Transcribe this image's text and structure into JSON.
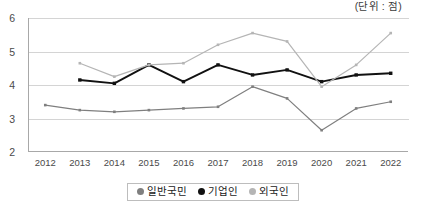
{
  "unit_label": "(단위 : 점)",
  "legend": {
    "position": "bottom-center",
    "items": [
      {
        "label": "일반국민",
        "color": "#7f7f7f"
      },
      {
        "label": "기업인",
        "color": "#111111"
      },
      {
        "label": "외국인",
        "color": "#b5b5b5"
      }
    ]
  },
  "axis": {
    "y_ticks": [
      "2",
      "3",
      "4",
      "5",
      "6"
    ],
    "x_ticks": [
      "2012",
      "2013",
      "2014",
      "2015",
      "2016",
      "2017",
      "2018",
      "2019",
      "2020",
      "2021",
      "2022"
    ]
  },
  "chart_data": {
    "type": "line",
    "title": "",
    "subtitle": "",
    "xlabel": "",
    "ylabel": "",
    "unit": "(단위 : 점)",
    "ylim": [
      2,
      6
    ],
    "ytick_values": [
      2,
      3,
      4,
      5,
      6
    ],
    "grid": true,
    "legend_position": "bottom-center",
    "categories": [
      "2012",
      "2013",
      "2014",
      "2015",
      "2016",
      "2017",
      "2018",
      "2019",
      "2020",
      "2021",
      "2022"
    ],
    "series": [
      {
        "name": "일반국민",
        "color": "#7f7f7f",
        "marker": "square",
        "values": [
          3.4,
          3.25,
          3.2,
          3.25,
          3.3,
          3.35,
          3.95,
          3.6,
          2.65,
          3.3,
          3.5
        ]
      },
      {
        "name": "기업인",
        "color": "#111111",
        "marker": "square",
        "values": [
          null,
          4.15,
          4.05,
          4.6,
          4.1,
          4.6,
          4.3,
          4.45,
          4.1,
          4.3,
          4.35
        ]
      },
      {
        "name": "외국인",
        "color": "#b5b5b5",
        "marker": "square",
        "values": [
          null,
          4.65,
          4.25,
          4.6,
          4.65,
          5.2,
          5.55,
          5.3,
          3.95,
          4.6,
          5.55
        ]
      }
    ]
  }
}
